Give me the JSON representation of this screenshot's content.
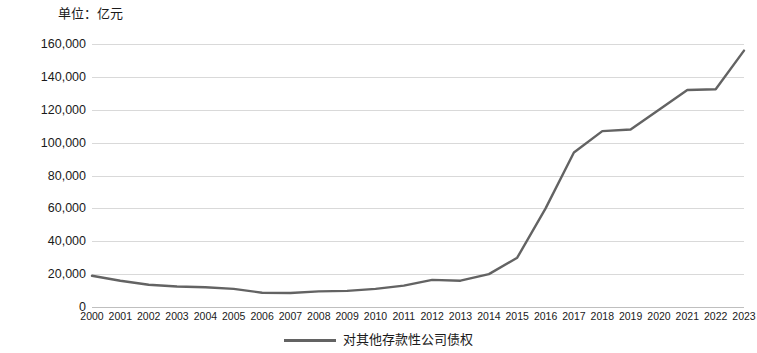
{
  "unit_caption": "单位：亿元",
  "legend": {
    "swatch_name": "series-line-swatch",
    "label": "对其他存款性公司债权"
  },
  "colors": {
    "line": "#636363",
    "gridline": "#d9d9d9",
    "axis": "#bfbfbf",
    "text": "#1a1a1a",
    "background": "#ffffff"
  },
  "chart_data": {
    "type": "line",
    "title": "",
    "subtitle": "",
    "xlabel": "",
    "ylabel": "单位：亿元",
    "categories": [
      "2000",
      "2001",
      "2002",
      "2003",
      "2004",
      "2005",
      "2006",
      "2007",
      "2008",
      "2009",
      "2010",
      "2011",
      "2012",
      "2013",
      "2014",
      "2015",
      "2016",
      "2017",
      "2018",
      "2019",
      "2020",
      "2021",
      "2022",
      "2023"
    ],
    "series": [
      {
        "name": "对其他存款性公司债权",
        "color": "#636363",
        "values": [
          19000,
          16000,
          13500,
          12500,
          12000,
          11000,
          8700,
          8500,
          9500,
          9800,
          11000,
          13000,
          16500,
          16000,
          20000,
          30000,
          60000,
          94000,
          107000,
          108000,
          120000,
          132000,
          132500,
          156000
        ]
      }
    ],
    "ylim": [
      0,
      160000
    ],
    "yticks": [
      0,
      20000,
      40000,
      60000,
      80000,
      100000,
      120000,
      140000,
      160000
    ],
    "ytick_labels": [
      "0",
      "20,000",
      "40,000",
      "60,000",
      "80,000",
      "100,000",
      "120,000",
      "140,000",
      "160,000"
    ],
    "grid": true,
    "grid_axis": "y",
    "legend_position": "bottom",
    "markers": false,
    "annotations": []
  }
}
